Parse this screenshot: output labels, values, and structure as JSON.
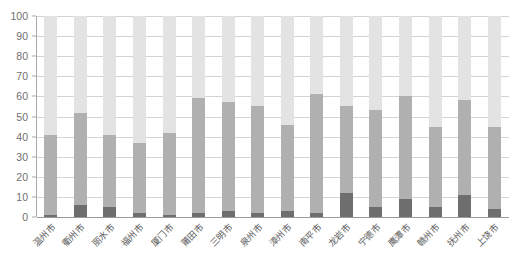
{
  "chart_data": {
    "type": "bar",
    "title": "",
    "subtitle": "",
    "xlabel": "",
    "ylabel": "",
    "ylim": [
      0,
      100
    ],
    "yticks": [
      0,
      10,
      20,
      30,
      40,
      50,
      60,
      70,
      80,
      90,
      100
    ],
    "ytick_labels": [
      "0",
      "10",
      "20",
      "30",
      "40",
      "50",
      "60",
      "70",
      "80",
      "90",
      "100"
    ],
    "grid": true,
    "legend": "none",
    "stacked": true,
    "normalized_total": 100,
    "categories": [
      "温州市",
      "衢州市",
      "丽水市",
      "福州市",
      "厦门市",
      "莆田市",
      "三明市",
      "泉州市",
      "漳州市",
      "南平市",
      "龙岩市",
      "宁德市",
      "鹰潭市",
      "赣州市",
      "抚州市",
      "上饶市"
    ],
    "series": [
      {
        "name": "bottom-segment",
        "color": "#6e6e6e",
        "values": [
          1,
          6,
          5,
          2,
          1,
          2,
          3,
          2,
          3,
          2,
          12,
          5,
          9,
          5,
          11,
          4
        ]
      },
      {
        "name": "middle-segment",
        "color": "#b0b0b0",
        "values": [
          40,
          46,
          36,
          35,
          41,
          57,
          54,
          53,
          43,
          59,
          43,
          48,
          51,
          40,
          47,
          41
        ]
      },
      {
        "name": "top-segment",
        "color": "#e3e3e3",
        "values": [
          59,
          48,
          59,
          63,
          58,
          41,
          43,
          45,
          54,
          39,
          45,
          47,
          40,
          55,
          42,
          55
        ]
      }
    ],
    "cumulative_tops": {
      "bottom_plus_middle": [
        41,
        52,
        41,
        37,
        42,
        59,
        57,
        55,
        46,
        61,
        55,
        53,
        60,
        45,
        58,
        45
      ]
    },
    "colors": {
      "bottom": "#6e6e6e",
      "middle": "#b0b0b0",
      "top": "#e3e3e3",
      "gridline": "#d4d4d4",
      "axis": "#a9a9a9",
      "tick_text": "#6f6f6f",
      "category_text": "#5a5a5a",
      "background": "#ffffff"
    }
  }
}
